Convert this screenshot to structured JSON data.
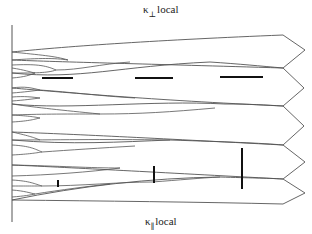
{
  "labels": {
    "top": {
      "symbol": "κ",
      "subscript": "⊥",
      "text": "local"
    },
    "bottom": {
      "symbol": "κ",
      "subscript": "∥",
      "text": "local"
    }
  },
  "style": {
    "line_color": "#555555",
    "bar_color": "#111111",
    "background": "#ffffff"
  },
  "axis": {
    "x": 12,
    "y1": 25,
    "y2": 222
  },
  "chevron": {
    "points": [
      [
        283,
        35
      ],
      [
        305,
        50
      ],
      [
        283,
        68
      ],
      [
        304,
        88
      ],
      [
        283,
        106
      ],
      [
        304,
        126
      ],
      [
        283,
        145
      ],
      [
        305,
        162
      ],
      [
        283,
        179
      ],
      [
        305,
        193
      ],
      [
        283,
        204
      ]
    ]
  },
  "main_lines": [
    {
      "d": "M12,52 C70,46 160,40 283,35"
    },
    {
      "d": "M12,60 C60,62 150,64 283,68"
    },
    {
      "d": "M12,73 C80,80 120,66 210,62 C240,64 260,66 283,68"
    },
    {
      "d": "M12,88 C60,92 150,100 283,106"
    },
    {
      "d": "M12,104 C70,110 150,100 225,104 C250,104 265,105 283,106"
    },
    {
      "d": "M12,132 C70,134 150,138 283,145"
    },
    {
      "d": "M12,140 C70,145 120,142 170,140 C230,142 260,143 283,145"
    },
    {
      "d": "M12,165 C80,168 150,172 283,179"
    },
    {
      "d": "M12,200 C80,186 150,178 220,177 C250,178 265,178 283,179"
    },
    {
      "d": "M12,200 C100,201 200,202 283,204"
    }
  ],
  "branches": [
    {
      "d": "M12,52 C40,55 55,56 68,60"
    },
    {
      "d": "M12,60 C40,58 55,58 68,60"
    },
    {
      "d": "M12,65 C35,64 45,65 56,70"
    },
    {
      "d": "M12,73 C35,73 48,73 56,70"
    },
    {
      "d": "M56,70 C80,70 100,64 130,62"
    },
    {
      "d": "M12,68 C25,70 30,72 35,73"
    },
    {
      "d": "M12,78 C25,77 30,75 35,73"
    },
    {
      "d": "M12,88 C25,86 32,88 40,90"
    },
    {
      "d": "M12,93 C25,92 32,91 40,90"
    },
    {
      "d": "M12,97 C25,96 32,97 40,98"
    },
    {
      "d": "M12,101 C25,100 32,99 40,98"
    },
    {
      "d": "M40,90 C70,92 100,96 135,98"
    },
    {
      "d": "M12,104 C40,108 60,110 100,114"
    },
    {
      "d": "M12,115 C40,114 60,114 100,114"
    },
    {
      "d": "M100,114 C140,114 170,112 215,108"
    },
    {
      "d": "M12,115 C30,116 35,117 40,118"
    },
    {
      "d": "M12,122 C30,121 35,119 40,118"
    },
    {
      "d": "M12,132 C30,136 35,138 40,140"
    },
    {
      "d": "M12,140 C50,140 100,139 170,140"
    },
    {
      "d": "M12,145 C30,146 35,149 42,152"
    },
    {
      "d": "M12,155 C30,154 35,153 42,152"
    },
    {
      "d": "M42,152 C70,150 100,148 135,146"
    },
    {
      "d": "M12,165 C60,166 90,168 120,168"
    },
    {
      "d": "M12,176 C50,175 90,172 120,168"
    },
    {
      "d": "M12,180 C30,181 35,184 42,186"
    },
    {
      "d": "M12,186 C30,186 36,186 42,186"
    },
    {
      "d": "M42,186 C80,186 120,182 152,182"
    },
    {
      "d": "M152,182 C180,180 200,178 220,177"
    },
    {
      "d": "M12,190 C25,191 30,193 35,194"
    },
    {
      "d": "M12,197 C25,196 30,195 35,194"
    },
    {
      "d": "M35,194 C60,190 90,186 110,184"
    }
  ],
  "bars": {
    "horizontal": [
      {
        "x1": 42,
        "x2": 73,
        "y": 78
      },
      {
        "x1": 135,
        "x2": 173,
        "y": 78
      },
      {
        "x1": 220,
        "x2": 263,
        "y": 77
      }
    ],
    "vertical": [
      {
        "x": 58,
        "y1": 180,
        "y2": 187
      },
      {
        "x": 154,
        "y1": 166,
        "y2": 183
      },
      {
        "x": 242,
        "y1": 148,
        "y2": 189
      }
    ]
  }
}
